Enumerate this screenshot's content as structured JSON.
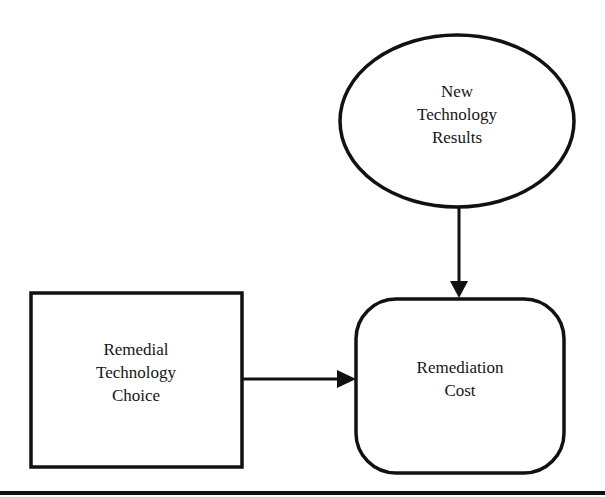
{
  "diagram": {
    "nodes": [
      {
        "id": "new-technology-results",
        "shape": "ellipse",
        "lines": [
          "New",
          "Technology",
          "Results"
        ]
      },
      {
        "id": "remedial-technology-choice",
        "shape": "rectangle",
        "lines": [
          "Remedial",
          "Technology",
          "Choice"
        ]
      },
      {
        "id": "remediation-cost",
        "shape": "rounded-rectangle",
        "lines": [
          "Remediation",
          "Cost"
        ]
      }
    ],
    "edges": [
      {
        "from": "new-technology-results",
        "to": "remediation-cost",
        "direction": "down"
      },
      {
        "from": "remedial-technology-choice",
        "to": "remediation-cost",
        "direction": "right"
      }
    ],
    "colors": {
      "stroke": "#111111",
      "background": "#ffffff"
    }
  }
}
